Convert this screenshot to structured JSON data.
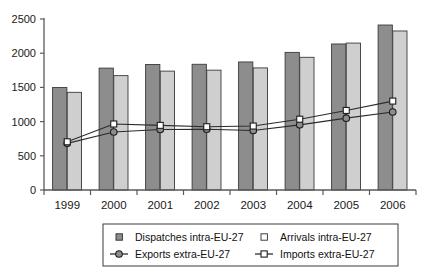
{
  "chart_data": {
    "type": "bar",
    "title": "",
    "subtitle": "",
    "xlabel": "",
    "ylabel": "",
    "ylim": [
      0,
      2500
    ],
    "ytick_step": 500,
    "yticks": [
      "0",
      "500",
      "1000",
      "1500",
      "2000",
      "2500"
    ],
    "grid": false,
    "legend_position": "bottom",
    "categories": [
      "1999",
      "2000",
      "2001",
      "2002",
      "2003",
      "2004",
      "2005",
      "2006"
    ],
    "series": [
      {
        "name": "Dispatches intra-EU-27",
        "kind": "bar",
        "color": "#8d8d8d",
        "values": [
          1498,
          1782,
          1835,
          1838,
          1872,
          2012,
          2135,
          2412
        ]
      },
      {
        "name": "Arrivals intra-EU-27",
        "kind": "bar",
        "color": "#cfcfcf",
        "values": [
          1428,
          1672,
          1738,
          1752,
          1785,
          1940,
          2148,
          2325
        ]
      },
      {
        "name": "Exports extra-EU-27",
        "kind": "line",
        "color": "#2b2b2b",
        "marker": "filled-circle",
        "values": [
          682,
          848,
          885,
          888,
          870,
          953,
          1050,
          1140
        ]
      },
      {
        "name": "Imports extra-EU-27",
        "kind": "line",
        "color": "#2b2b2b",
        "marker": "open-square",
        "values": [
          705,
          965,
          945,
          925,
          935,
          1035,
          1163,
          1300
        ]
      }
    ]
  },
  "legend": {
    "entries": [
      {
        "label": "Dispatches intra-EU-27",
        "marker": "filled-square-swatch",
        "color": "#8d8d8d"
      },
      {
        "label": "Arrivals intra-EU-27",
        "marker": "open-square-swatch",
        "color": "#e8e8e8"
      },
      {
        "label": "Exports extra-EU-27",
        "marker": "line-filled-circle",
        "color": "#2b2b2b"
      },
      {
        "label": "Imports extra-EU-27",
        "marker": "line-open-square",
        "color": "#2b2b2b"
      }
    ]
  },
  "axis": {
    "y_ticks": [
      "2500",
      "2000",
      "1500",
      "1000",
      "500",
      "0"
    ],
    "x_ticks": [
      "1999",
      "2000",
      "2001",
      "2002",
      "2003",
      "2004",
      "2005",
      "2006"
    ]
  },
  "colors": {
    "bar_dark": "#8d8d8d",
    "bar_light": "#cfcfcf",
    "line": "#2b2b2b",
    "axis": "#5a5a5a",
    "text": "#1a1a1a",
    "background": "#ffffff"
  }
}
